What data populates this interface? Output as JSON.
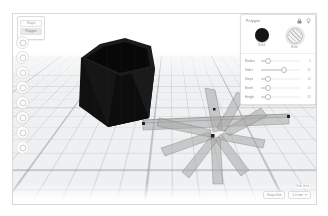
{
  "app": {
    "name": "3d-design-editor"
  },
  "left_toolbar": {
    "card": {
      "row1_label": "Shape",
      "row2_label": "Polygon"
    },
    "buttons": [
      {
        "name": "sidebar-button-1",
        "icon": "circle-icon"
      },
      {
        "name": "sidebar-button-2",
        "icon": "circle-icon"
      },
      {
        "name": "sidebar-button-3",
        "icon": "circle-icon"
      },
      {
        "name": "sidebar-button-4",
        "icon": "circle-icon"
      },
      {
        "name": "sidebar-button-5",
        "icon": "circle-icon"
      },
      {
        "name": "sidebar-button-6",
        "icon": "circle-icon"
      },
      {
        "name": "sidebar-button-7",
        "icon": "circle-icon"
      },
      {
        "name": "sidebar-button-8",
        "icon": "circle-icon"
      }
    ]
  },
  "inspector": {
    "title": "Polygon",
    "icons": {
      "lock": "lock-icon",
      "light": "lightbulb-icon"
    },
    "swatches": [
      {
        "label": "Solid",
        "type": "solid",
        "color": "#161616"
      },
      {
        "label": "Hole",
        "type": "hole",
        "color": "#cccccc"
      }
    ],
    "properties": [
      {
        "label": "Radius",
        "value": "5",
        "pos": 18
      },
      {
        "label": "Sides",
        "value": "32",
        "pos": 58
      },
      {
        "label": "Steps",
        "value": "10",
        "pos": 18
      },
      {
        "label": "Bevel",
        "value": "10",
        "pos": 18
      },
      {
        "label": "Height",
        "value": "20",
        "pos": 18
      }
    ]
  },
  "viewport": {
    "objects": [
      {
        "name": "black-hexagonal-prism",
        "color": "#131313"
      },
      {
        "name": "translucent-bar-star",
        "color": "#9a9a9a"
      }
    ],
    "workplane_color": "#eef0f1"
  },
  "hud": {
    "grid_label": "Edit Grid",
    "snap_label": "Snap Grid",
    "snap_value": "1.0 mm"
  }
}
